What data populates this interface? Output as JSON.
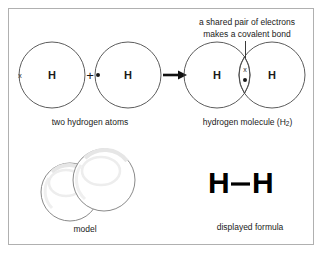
{
  "figure": {
    "border_color": "#b0b0b0",
    "background": "#ffffff",
    "ink_color": "#1a1a1a",
    "circle_stroke": "#4a4a4a"
  },
  "reactants": {
    "atom_left": {
      "label": "H",
      "electron_symbol": "x",
      "electron_type": "cross"
    },
    "plus": "+",
    "atom_right": {
      "label": "H",
      "electron_symbol": "●",
      "electron_type": "dot"
    },
    "caption": "two hydrogen atoms"
  },
  "arrow": {
    "symbol": "→",
    "direction": "right",
    "name": "reaction-arrow"
  },
  "product": {
    "atom_left": {
      "label": "H"
    },
    "atom_right": {
      "label": "H"
    },
    "shared_pair": {
      "electron_cross": "x",
      "electron_dot": "●"
    },
    "annotation": {
      "line1": "a shared pair of electrons",
      "line2": "makes a covalent bond"
    },
    "caption_prefix": "hydrogen molecule (H",
    "caption_sub": "2",
    "caption_suffix": ")"
  },
  "model": {
    "caption": "model",
    "sphere_count": 2,
    "sphere_fill": "#ffffff",
    "sphere_stroke": "#8a8a8a",
    "highlight_color": "#f2f2f2"
  },
  "displayed_formula": {
    "left_atom": "H",
    "bond": "—",
    "right_atom": "H",
    "caption": "displayed formula"
  }
}
